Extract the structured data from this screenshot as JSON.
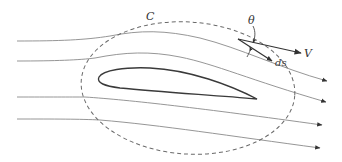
{
  "figure": {
    "labels": {
      "contour": "C",
      "angle": "θ",
      "velocity": "V",
      "line_element": "ds"
    },
    "elements": {
      "streamlines": 4,
      "contour_style": "dashed",
      "body": "airfoil"
    },
    "colors": {
      "streamline": "#8a8a8a",
      "contour": "#6a6a6a",
      "airfoil": "#3a3a3a",
      "vector": "#333333",
      "background": "#ffffff"
    }
  }
}
